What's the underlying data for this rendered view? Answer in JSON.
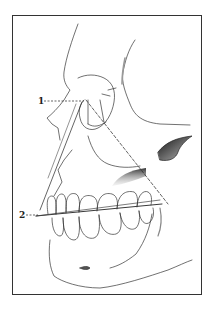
{
  "figure": {
    "type": "anatomical-line-drawing",
    "labels": [
      {
        "id": "1",
        "text": "1"
      },
      {
        "id": "2",
        "text": "2"
      }
    ],
    "colors": {
      "ink": "#222222",
      "background": "#ffffff",
      "frame": "#333333"
    }
  }
}
